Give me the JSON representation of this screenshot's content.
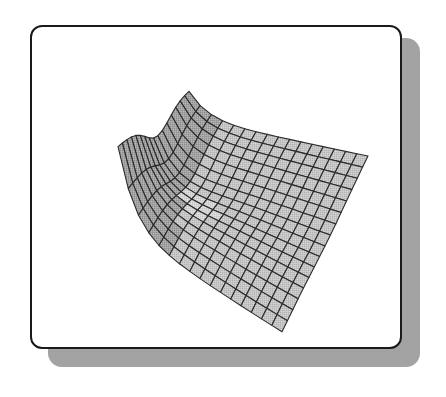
{
  "figure": {
    "frame_color": "#1a1a1a",
    "shadow_color": "#a9a9a9",
    "surface_fill": "#c4c4c4",
    "surface_fill_dark": "#9a9a9a",
    "mesh_line_color": "#2a2a2a"
  },
  "chart_data": {
    "type": "surface",
    "title": "",
    "xlabel": "",
    "ylabel": "",
    "zlabel": "",
    "axes_visible": false,
    "grid": false,
    "legend": null,
    "mesh": {
      "rows": 16,
      "cols": 16
    },
    "projection_corners": {
      "top": [
        189,
        119
      ],
      "right": [
        368,
        162
      ],
      "bottom": [
        282,
        332
      ],
      "left": [
        72,
        178
      ]
    },
    "shape": "trough/saddle surface with a sharp raised ridge along the left edge and a shallow crease running from the left toward the center; far (right) side nearly flat"
  }
}
